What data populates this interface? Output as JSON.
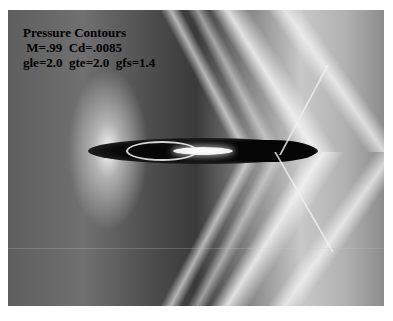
{
  "figure": {
    "title": "Pressure Contours",
    "line2": " M=.99  Cd=.0085",
    "line3": "gle=2.0  gte=2.0  gfs=1.4"
  },
  "colors": {
    "background": "#ffffff",
    "body_highlight": "#ffffff",
    "low_pressure": "#000000",
    "field_mid": "#6b6b6b"
  }
}
